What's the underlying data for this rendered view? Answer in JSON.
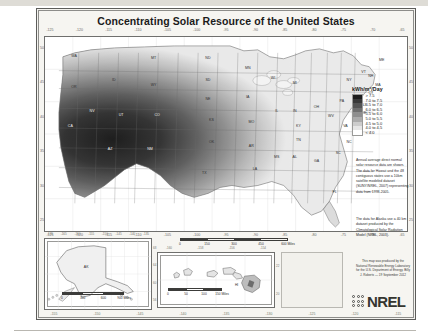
{
  "poster": {
    "title": "Concentrating Solar Resource of the United States"
  },
  "legend": {
    "title": "kWh/m²/Day",
    "classes": [
      {
        "label": "> 7.5",
        "color": "#1d1d1d"
      },
      {
        "label": "7.0 to 7.5",
        "color": "#393939"
      },
      {
        "label": "6.5 to 7.0",
        "color": "#545454"
      },
      {
        "label": "6.0 to 6.5",
        "color": "#6f6f6f"
      },
      {
        "label": "5.5 to 6.0",
        "color": "#8e8e8e"
      },
      {
        "label": "5.0 to 5.5",
        "color": "#ababab"
      },
      {
        "label": "4.5 to 5.0",
        "color": "#cccccc"
      },
      {
        "label": "4.0 to 4.5",
        "color": "#e6e6e6"
      },
      {
        "label": "< 4.0",
        "color": "#ffffff"
      }
    ]
  },
  "notes": {
    "note_1": "Annual average direct normal solar resource data are shown. The data for Hawaii and the 48 contiguous states use a 10km satellite modeled dataset (SUNY/NREL, 2007) representing data from 1998-2005.",
    "note_2": "The data for Alaska use a 40 km dataset produced by the Climatological Solar Radiation Model (NREL, 2003)."
  },
  "credit": {
    "text": "This map was produced by the National Renewable Energy Laboratory for the U.S. Department of Energy. Billy J. Roberts — 19 September 2012",
    "logo_word": "NREL"
  },
  "scalebars": {
    "main": {
      "labels": [
        "0",
        "150",
        "300",
        "450",
        "600 Miles"
      ]
    },
    "alaska": {
      "labels": [
        "0",
        "300",
        "600",
        "900 Miles"
      ]
    },
    "hawaii": {
      "labels": [
        "0",
        "50",
        "100",
        "150 Miles"
      ]
    }
  },
  "axes": {
    "main_lon_labels": [
      "-125",
      "-120",
      "-115",
      "-110",
      "-105",
      "-100",
      "-95",
      "-90",
      "-85",
      "-80",
      "-75",
      "-70",
      "-65"
    ],
    "main_lat_labels": [
      "50",
      "45",
      "40",
      "35",
      "30",
      "25"
    ],
    "alaska_lon_labels": [
      "-170",
      "-165",
      "-160",
      "-155",
      "-150",
      "-145",
      "-140",
      "-135"
    ],
    "alaska_lat_labels": [
      "68",
      "64",
      "60",
      "56"
    ],
    "hawaii_lon_labels": [
      "-160",
      "-158",
      "-156",
      "-154"
    ],
    "hawaii_lat_labels": [
      "22",
      "20"
    ],
    "bottom_lon_labels": [
      "-155",
      "-150",
      "-145",
      "-140",
      "-135",
      "-130",
      "-125",
      "-120",
      "-115"
    ]
  },
  "insets": {
    "alaska_label": "AK",
    "hawaii_label": "HI"
  },
  "chart_data": {
    "type": "heatmap",
    "title": "Concentrating Solar Resource of the United States",
    "ylabel": "Latitude",
    "xlabel": "Longitude",
    "legend_title": "kWh/m²/Day",
    "legend_position": "right",
    "grid": true,
    "xlim": [
      -125,
      -65
    ],
    "ylim": [
      24,
      50
    ],
    "bins": [
      {
        "label": "> 7.5",
        "min": 7.5,
        "max": null,
        "color": "#1d1d1d"
      },
      {
        "label": "7.0 to 7.5",
        "min": 7.0,
        "max": 7.5,
        "color": "#393939"
      },
      {
        "label": "6.5 to 7.0",
        "min": 6.5,
        "max": 7.0,
        "color": "#545454"
      },
      {
        "label": "6.0 to 6.5",
        "min": 6.0,
        "max": 6.5,
        "color": "#6f6f6f"
      },
      {
        "label": "5.5 to 6.0",
        "min": 5.5,
        "max": 6.0,
        "color": "#8e8e8e"
      },
      {
        "label": "5.0 to 5.5",
        "min": 5.0,
        "max": 5.5,
        "color": "#ababab"
      },
      {
        "label": "4.5 to 5.0",
        "min": 4.5,
        "max": 5.0,
        "color": "#cccccc"
      },
      {
        "label": "4.0 to 4.5",
        "min": 4.0,
        "max": 4.5,
        "color": "#e6e6e6"
      },
      {
        "label": "< 4.0",
        "min": null,
        "max": 4.0,
        "color": "#ffffff"
      }
    ],
    "states": [
      {
        "code": "WA",
        "x": 8,
        "y": 10,
        "value": 3.9
      },
      {
        "code": "OR",
        "x": 8,
        "y": 26,
        "value": 4.8
      },
      {
        "code": "ID",
        "x": 19,
        "y": 22,
        "value": 5.3
      },
      {
        "code": "MT",
        "x": 30,
        "y": 11,
        "value": 4.6
      },
      {
        "code": "ND",
        "x": 45,
        "y": 11,
        "value": 4.2
      },
      {
        "code": "SD",
        "x": 45,
        "y": 22,
        "value": 4.6
      },
      {
        "code": "WY",
        "x": 30,
        "y": 25,
        "value": 5.8
      },
      {
        "code": "NV",
        "x": 13,
        "y": 38,
        "value": 6.8
      },
      {
        "code": "CA",
        "x": 7,
        "y": 46,
        "value": 6.9
      },
      {
        "code": "UT",
        "x": 21,
        "y": 40,
        "value": 6.4
      },
      {
        "code": "CO",
        "x": 31,
        "y": 40,
        "value": 6.3
      },
      {
        "code": "NE",
        "x": 45,
        "y": 32,
        "value": 4.9
      },
      {
        "code": "KS",
        "x": 46,
        "y": 43,
        "value": 5.3
      },
      {
        "code": "OK",
        "x": 46,
        "y": 54,
        "value": 5.4
      },
      {
        "code": "AZ",
        "x": 18,
        "y": 58,
        "value": 7.5
      },
      {
        "code": "NM",
        "x": 29,
        "y": 58,
        "value": 7.3
      },
      {
        "code": "TX",
        "x": 44,
        "y": 70,
        "value": 5.6
      },
      {
        "code": "MN",
        "x": 56,
        "y": 16,
        "value": 4.2
      },
      {
        "code": "IA",
        "x": 56,
        "y": 31,
        "value": 4.3
      },
      {
        "code": "MO",
        "x": 57,
        "y": 44,
        "value": 4.5
      },
      {
        "code": "AR",
        "x": 57,
        "y": 56,
        "value": 4.6
      },
      {
        "code": "LA",
        "x": 58,
        "y": 68,
        "value": 4.6
      },
      {
        "code": "WI",
        "x": 63,
        "y": 21,
        "value": 3.9
      },
      {
        "code": "IL",
        "x": 64,
        "y": 38,
        "value": 4.1
      },
      {
        "code": "MS",
        "x": 64,
        "y": 62,
        "value": 4.5
      },
      {
        "code": "MI",
        "x": 69,
        "y": 24,
        "value": 3.7
      },
      {
        "code": "IN",
        "x": 69,
        "y": 38,
        "value": 3.9
      },
      {
        "code": "KY",
        "x": 70,
        "y": 46,
        "value": 4.0
      },
      {
        "code": "TN",
        "x": 70,
        "y": 53,
        "value": 4.2
      },
      {
        "code": "AL",
        "x": 69,
        "y": 62,
        "value": 4.4
      },
      {
        "code": "OH",
        "x": 75,
        "y": 36,
        "value": 3.7
      },
      {
        "code": "GA",
        "x": 75,
        "y": 64,
        "value": 4.4
      },
      {
        "code": "FL",
        "x": 80,
        "y": 80,
        "value": 4.6
      },
      {
        "code": "WV",
        "x": 79,
        "y": 41,
        "value": 3.7
      },
      {
        "code": "PA",
        "x": 82,
        "y": 33,
        "value": 3.6
      },
      {
        "code": "NY",
        "x": 84,
        "y": 22,
        "value": 3.5
      },
      {
        "code": "VA",
        "x": 83,
        "y": 46,
        "value": 3.9
      },
      {
        "code": "NC",
        "x": 84,
        "y": 54,
        "value": 4.2
      },
      {
        "code": "SC",
        "x": 81,
        "y": 60,
        "value": 4.3
      },
      {
        "code": "ME",
        "x": 93,
        "y": 12,
        "value": 3.6
      },
      {
        "code": "VT",
        "x": 88,
        "y": 18,
        "value": 3.5
      },
      {
        "code": "NH",
        "x": 90,
        "y": 20,
        "value": 3.5
      },
      {
        "code": "MA",
        "x": 92,
        "y": 25,
        "value": 3.7
      },
      {
        "code": "CT",
        "x": 90,
        "y": 29,
        "value": 3.7
      },
      {
        "code": "NJ",
        "x": 88,
        "y": 35,
        "value": 3.8
      },
      {
        "code": "MD",
        "x": 86,
        "y": 40,
        "value": 3.8
      },
      {
        "code": "DE",
        "x": 88,
        "y": 39,
        "value": 3.8
      }
    ]
  }
}
